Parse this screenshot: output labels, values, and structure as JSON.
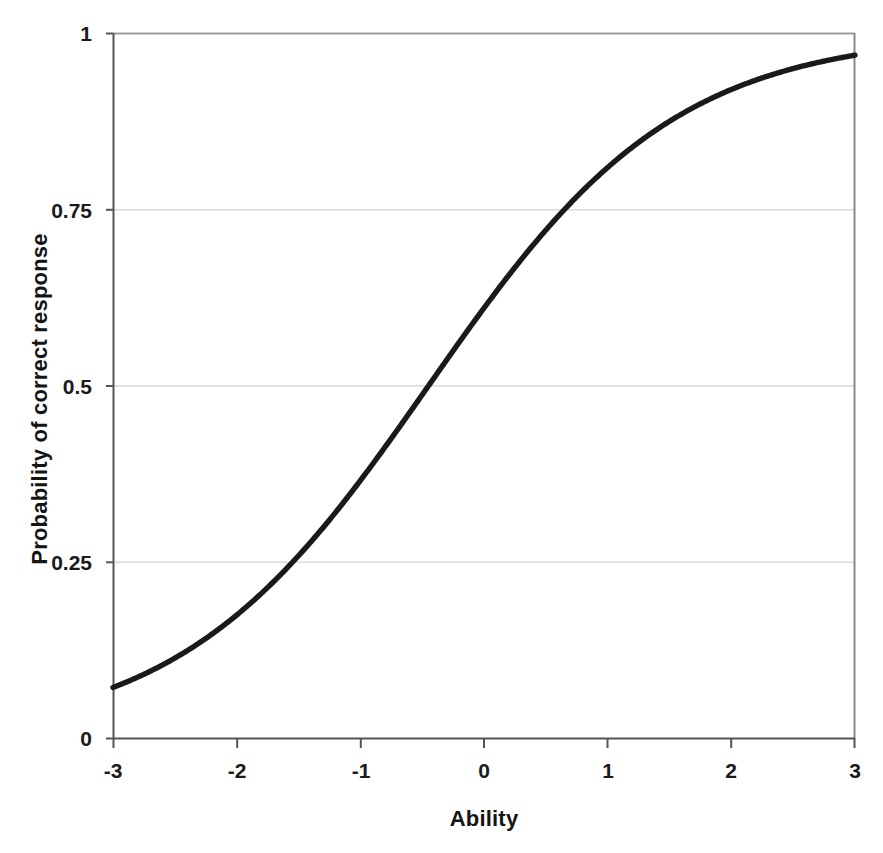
{
  "figure": {
    "background_color": "#ffffff",
    "width": 883,
    "height": 853
  },
  "axes": {
    "x_title": "Ability",
    "y_title": "Probability of correct response",
    "x_tick_labels": [
      "-3",
      "-2",
      "-1",
      "0",
      "1",
      "2",
      "3"
    ],
    "y_tick_labels": [
      "0",
      "0.25",
      "0.5",
      "0.75",
      "1"
    ]
  },
  "chart_data": {
    "type": "line",
    "title": "",
    "subtitle": "",
    "xlabel": "Ability",
    "ylabel": "Probability of correct response",
    "xlim": [
      -3,
      3
    ],
    "ylim": [
      0,
      1
    ],
    "xticks": [
      -3,
      -2,
      -1,
      0,
      1,
      2,
      3
    ],
    "yticks": [
      0,
      0.25,
      0.5,
      0.75,
      1
    ],
    "xtick_labels": [
      "-3",
      "-2",
      "-1",
      "0",
      "1",
      "2",
      "3"
    ],
    "ytick_labels": [
      "0",
      "0.25",
      "0.5",
      "0.75",
      "1"
    ],
    "grid": "horizontal",
    "legend": "none",
    "annotations": [],
    "series": [
      {
        "name": "Item characteristic curve",
        "color": "#1a1a1a",
        "line_width": 5,
        "model": "2PL logistic: P(theta) = 1 / (1 + exp(-a*(theta - b)))",
        "parameters": {
          "a": 1.0,
          "b": -0.45,
          "c": 0.0
        },
        "x": [
          -3,
          -2.75,
          -2.5,
          -2.25,
          -2,
          -1.75,
          -1.5,
          -1.25,
          -1,
          -0.75,
          -0.5,
          -0.45,
          -0.25,
          0,
          0.25,
          0.5,
          0.65,
          0.75,
          1,
          1.25,
          1.5,
          1.75,
          2,
          2.25,
          2.5,
          2.75,
          3
        ],
        "values": [
          0.073,
          0.092,
          0.115,
          0.143,
          0.177,
          0.217,
          0.264,
          0.318,
          0.378,
          0.441,
          0.507,
          0.5,
          0.55,
          0.611,
          0.668,
          0.72,
          0.75,
          0.767,
          0.808,
          0.844,
          0.874,
          0.899,
          0.92,
          0.937,
          0.951,
          0.961,
          0.97
        ]
      }
    ],
    "reference_points": [
      {
        "label": "curve at ability -3",
        "x": -3,
        "y": 0.073
      },
      {
        "label": "p = 0.25 crossing",
        "x": -1.55,
        "y": 0.25
      },
      {
        "label": "p = 0.5 crossing (difficulty)",
        "x": -0.45,
        "y": 0.5
      },
      {
        "label": "p = 0.75 crossing",
        "x": 0.65,
        "y": 0.75
      },
      {
        "label": "curve at ability 3",
        "x": 3,
        "y": 0.96
      }
    ]
  },
  "style": {
    "curve_color": "#1a1a1a",
    "gridline_color": "#d9d9d9",
    "top_gridline_color": "#9c9c9c",
    "spine_color": "#6e6e6e",
    "text_color": "#141414"
  }
}
